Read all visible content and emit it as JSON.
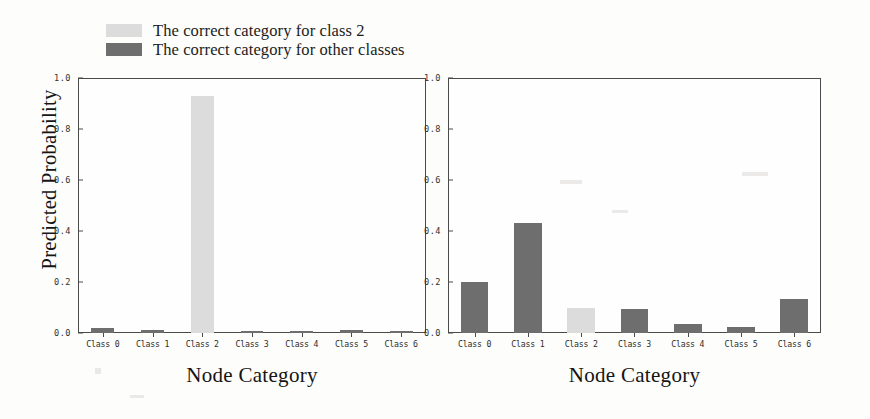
{
  "legend": {
    "items": [
      {
        "label": "The correct category for class 2",
        "color": "#dcdcdc",
        "key": "class2"
      },
      {
        "label": "The correct category for other classes",
        "color": "#6e6e6e",
        "key": "other"
      }
    ]
  },
  "axis": {
    "ylabel": "Predicted Probability",
    "xlabel_left": "Node Category",
    "xlabel_right": "Node Category",
    "yticks": [
      "0.0",
      "0.2",
      "0.4",
      "0.6",
      "0.8",
      "1.0"
    ],
    "ytick_values": [
      0.0,
      0.2,
      0.4,
      0.6,
      0.8,
      1.0
    ]
  },
  "colors": {
    "highlight": "#dcdcdc",
    "normal": "#6e6e6e",
    "frame": "#4a4a4a",
    "background": "#fdfdfb"
  },
  "chart_data": [
    {
      "type": "bar",
      "panel": "left",
      "title": "",
      "xlabel": "Node Category",
      "ylabel": "Predicted Probability",
      "categories": [
        "Class 0",
        "Class 1",
        "Class 2",
        "Class 3",
        "Class 4",
        "Class 5",
        "Class 6"
      ],
      "values": [
        0.018,
        0.012,
        0.93,
        0.008,
        0.008,
        0.012,
        0.008
      ],
      "bar_colors": [
        "#6e6e6e",
        "#6e6e6e",
        "#dcdcdc",
        "#6e6e6e",
        "#6e6e6e",
        "#6e6e6e",
        "#6e6e6e"
      ],
      "ylim": [
        0.0,
        1.0
      ],
      "grid": false,
      "legend_position": "above-left"
    },
    {
      "type": "bar",
      "panel": "right",
      "title": "",
      "xlabel": "Node Category",
      "ylabel": "Predicted Probability",
      "categories": [
        "Class 0",
        "Class 1",
        "Class 2",
        "Class 3",
        "Class 4",
        "Class 5",
        "Class 6"
      ],
      "values": [
        0.2,
        0.43,
        0.1,
        0.095,
        0.035,
        0.022,
        0.135
      ],
      "bar_colors": [
        "#6e6e6e",
        "#6e6e6e",
        "#dcdcdc",
        "#6e6e6e",
        "#6e6e6e",
        "#6e6e6e",
        "#6e6e6e"
      ],
      "ylim": [
        0.0,
        1.0
      ],
      "grid": false,
      "legend_position": "none"
    }
  ]
}
